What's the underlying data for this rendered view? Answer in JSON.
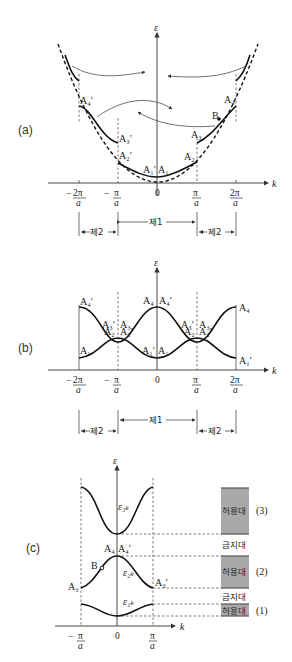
{
  "figure": {
    "panels": [
      {
        "id": "a",
        "label": "(a)",
        "y_axis_label": "ε",
        "x_axis_label": "k",
        "ticks": [
          "-2π/a",
          "-π/a",
          "0",
          "π/a",
          "2π/a"
        ],
        "tick_parts": {
          "m2pi_num": "2π",
          "m2pi_den": "a",
          "m2pi_sign": "−",
          "mpi_num": "π",
          "mpi_den": "a",
          "mpi_sign": "−",
          "zero": "0",
          "pi_num": "π",
          "pi_den": "a",
          "p2pi_num": "2π",
          "p2pi_den": "a"
        },
        "point_labels": {
          "A1": "A₁",
          "A1p": "A₁′",
          "A2": "A₂",
          "A2p": "A₂′",
          "A3": "A₃",
          "A3p": "A₃′",
          "A4": "A₄",
          "A4p": "A₄′",
          "B": "B"
        },
        "zones": {
          "zone1": "제1",
          "zone2_left": "제2",
          "zone2_right": "제2"
        }
      },
      {
        "id": "b",
        "label": "(b)",
        "y_axis_label": "ε",
        "x_axis_label": "k",
        "point_labels": {
          "A4p_left": "A₄′",
          "A4_center": "A₄",
          "A4p_center": "A₄′",
          "A4_right": "A₄",
          "A3p_l": "A₃′",
          "A3_l": "A₃",
          "A3p_r": "A₃′",
          "A3_r": "A₃",
          "A2_l": "A₂",
          "A2p_l": "A₂′",
          "A2_r": "A₂",
          "A2p_r": "A₂′",
          "A1_left": "A₁",
          "A1p_center": "A₁′",
          "A1_center": "A₁",
          "A1p_right": "A₁′"
        },
        "zones": {
          "zone1": "제1",
          "zone2_left": "제2",
          "zone2_right": "제2"
        }
      },
      {
        "id": "c",
        "label": "(c)",
        "y_axis_label": "ε",
        "x_axis_label": "k",
        "ticks": [
          "-π/a",
          "0",
          "π/a"
        ],
        "point_labels": {
          "A4": "A₄",
          "A4p": "A₄′",
          "B": "B",
          "A3": "A₃",
          "A3p": "A₃′",
          "e3k": "ε₃ₖ",
          "e2k": "ε₂ₖ",
          "e1k": "ε₁ₖ"
        },
        "bands": [
          {
            "name": "허용대",
            "index": "(3)"
          },
          {
            "name": "금지대"
          },
          {
            "name": "허용대",
            "index": "(2)"
          },
          {
            "name": "금지대"
          },
          {
            "name": "허용대",
            "index": "(1)"
          }
        ]
      }
    ],
    "colors": {
      "band_fill": "#a9a9a9",
      "band_edge": "#555555",
      "curve": "#111111"
    }
  }
}
